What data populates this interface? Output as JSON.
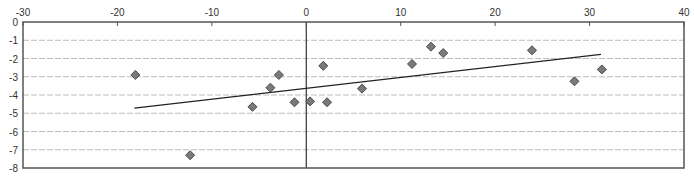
{
  "chart_data": {
    "type": "scatter",
    "title": "",
    "xlabel": "",
    "ylabel": "",
    "xlim": [
      -30,
      40
    ],
    "ylim": [
      -8,
      0
    ],
    "x_ticks": [
      -30,
      -20,
      -10,
      0,
      10,
      20,
      30,
      40
    ],
    "y_ticks": [
      0,
      -1,
      -2,
      -3,
      -4,
      -5,
      -6,
      -7,
      -8
    ],
    "x_axis_position": "top",
    "grid": {
      "horizontal": true,
      "vertical": false,
      "style": "dashed"
    },
    "legend": null,
    "series": [
      {
        "name": "points",
        "marker": "diamond",
        "color": "#7a7a7a",
        "points": [
          {
            "x": -18.1,
            "y": -2.9
          },
          {
            "x": -12.3,
            "y": -7.3
          },
          {
            "x": -5.7,
            "y": -4.65
          },
          {
            "x": -3.8,
            "y": -3.6
          },
          {
            "x": -2.9,
            "y": -2.9
          },
          {
            "x": -1.25,
            "y": -4.4
          },
          {
            "x": 0.4,
            "y": -4.35
          },
          {
            "x": 1.8,
            "y": -2.4
          },
          {
            "x": 2.2,
            "y": -4.4
          },
          {
            "x": 5.9,
            "y": -3.65
          },
          {
            "x": 11.2,
            "y": -2.3
          },
          {
            "x": 13.2,
            "y": -1.35
          },
          {
            "x": 14.5,
            "y": -1.7
          },
          {
            "x": 23.9,
            "y": -1.55
          },
          {
            "x": 28.4,
            "y": -3.25
          },
          {
            "x": 31.3,
            "y": -2.6
          }
        ]
      }
    ],
    "trendline": {
      "type": "linear",
      "color": "#222222",
      "x": [
        -18.2,
        31.2
      ],
      "y": [
        -4.72,
        -1.77
      ]
    }
  },
  "caption": "a) ...",
  "colors": {
    "axis": "#555555",
    "grid": "#bdbdbd",
    "marker_fill": "#7a7a7a",
    "marker_stroke": "#4a4a4a",
    "trendline": "#222222"
  }
}
